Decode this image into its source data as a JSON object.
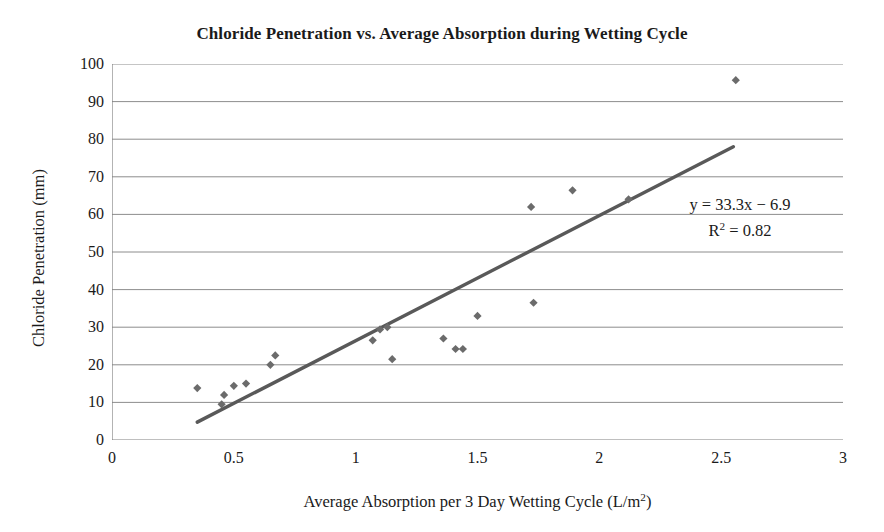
{
  "chart_data": {
    "type": "scatter",
    "title": "Chloride Penetration vs. Average Absorption during Wetting Cycle",
    "xlabel": "Average Absorption per 3 Day Wetting Cycle (L/m²)",
    "ylabel": "Chloride Penetration (mm)",
    "xlim": [
      0,
      3
    ],
    "ylim": [
      0,
      100
    ],
    "xticks": [
      "0",
      "0.5",
      "1",
      "1.5",
      "2",
      "2.5",
      "3"
    ],
    "xtick_values": [
      0,
      0.5,
      1,
      1.5,
      2,
      2.5,
      3
    ],
    "yticks": [
      "0",
      "10",
      "20",
      "30",
      "40",
      "50",
      "60",
      "70",
      "80",
      "90",
      "100"
    ],
    "ytick_values": [
      0,
      10,
      20,
      30,
      40,
      50,
      60,
      70,
      80,
      90,
      100
    ],
    "grid": "horizontal",
    "legend": "none",
    "marker_color": "#6b6b6b",
    "trendline_color": "#595959",
    "axis_color": "#808080",
    "series": [
      {
        "name": "Chloride penetration",
        "points": [
          [
            0.35,
            13.8
          ],
          [
            0.45,
            9.5
          ],
          [
            0.46,
            12.0
          ],
          [
            0.5,
            14.4
          ],
          [
            0.55,
            15.0
          ],
          [
            0.65,
            20.0
          ],
          [
            0.67,
            22.5
          ],
          [
            1.07,
            26.5
          ],
          [
            1.1,
            29.4
          ],
          [
            1.13,
            30.0
          ],
          [
            1.15,
            21.5
          ],
          [
            1.36,
            27.0
          ],
          [
            1.41,
            24.2
          ],
          [
            1.44,
            24.2
          ],
          [
            1.5,
            33.0
          ],
          [
            1.72,
            62.0
          ],
          [
            1.73,
            36.5
          ],
          [
            1.89,
            66.4
          ],
          [
            2.12,
            64.0
          ],
          [
            2.56,
            95.7
          ]
        ]
      }
    ],
    "trendline": {
      "equation": "y = 33.3x − 6.9",
      "r_squared_label": "R² = 0.82",
      "r_squared_base": "R",
      "r_squared_exp": "2",
      "r_squared_value": " = 0.82",
      "slope": 33.3,
      "intercept": -6.9,
      "x_start": 0.35,
      "x_end": 2.55
    }
  }
}
